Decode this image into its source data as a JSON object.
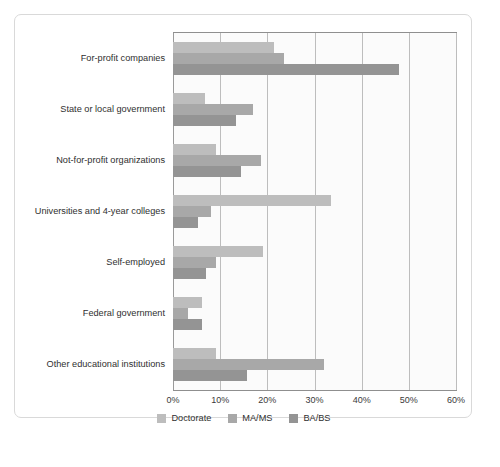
{
  "chart_data": {
    "type": "bar",
    "orientation": "horizontal",
    "title": "",
    "subtitle": "",
    "xlabel": "",
    "ylabel": "",
    "xlim": [
      0,
      60
    ],
    "xtick_labels": [
      "0%",
      "10%",
      "20%",
      "30%",
      "40%",
      "50%",
      "60%"
    ],
    "xtick_values": [
      0,
      10,
      20,
      30,
      40,
      50,
      60
    ],
    "grid": true,
    "legend_position": "bottom",
    "categories": [
      "For-profit companies",
      "State or local government",
      "Not-for-profit organizations",
      "Universities and 4-year colleges",
      "Self-employed",
      "Federal government",
      "Other educational institutions"
    ],
    "series": [
      {
        "name": "Doctorate",
        "color": "#bdbdbd",
        "values": [
          21.4,
          6.8,
          9.1,
          33.5,
          19.1,
          6.1,
          9.1
        ]
      },
      {
        "name": "MA/MS",
        "color": "#a8a8a8",
        "values": [
          23.5,
          17.0,
          18.6,
          8.0,
          9.1,
          3.2,
          32.0
        ]
      },
      {
        "name": "BA/BS",
        "color": "#949494",
        "values": [
          47.9,
          13.3,
          14.4,
          5.3,
          7.0,
          6.1,
          15.7
        ]
      }
    ]
  },
  "legend": {
    "items": [
      {
        "label": "Doctorate",
        "color": "#bdbdbd"
      },
      {
        "label": "MA/MS",
        "color": "#a8a8a8"
      },
      {
        "label": "BA/BS",
        "color": "#949494"
      }
    ]
  }
}
